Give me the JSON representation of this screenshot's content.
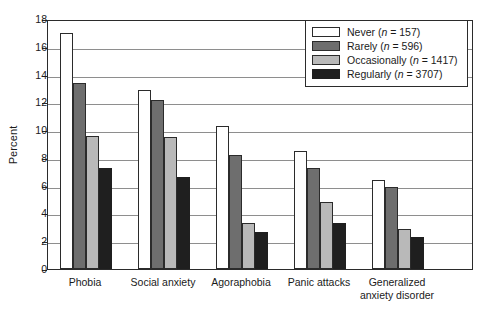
{
  "chart_data": {
    "type": "bar",
    "title": "",
    "xlabel": "",
    "ylabel": "Percent",
    "ylim": [
      0,
      18
    ],
    "ytick_step": 2,
    "yticks": [
      0,
      2,
      4,
      6,
      8,
      10,
      12,
      14,
      16,
      18
    ],
    "grid": true,
    "legend_position": "top-right",
    "categories": [
      "Phobia",
      "Social anxiety",
      "Agoraphobia",
      "Panic attacks",
      "Generalized anxiety disorder"
    ],
    "category_lines": [
      [
        "Phobia"
      ],
      [
        "Social anxiety"
      ],
      [
        "Agoraphobia"
      ],
      [
        "Panic attacks"
      ],
      [
        "Generalized",
        "anxiety disorder"
      ]
    ],
    "series": [
      {
        "name": "Never",
        "n": 157,
        "legend_label": "Never (n = 157)",
        "color": "#ffffff",
        "values": [
          17.0,
          12.9,
          10.3,
          8.5,
          6.4
        ]
      },
      {
        "name": "Rarely",
        "n": 596,
        "legend_label": "Rarely (n = 596)",
        "color": "#6e6e6e",
        "values": [
          13.4,
          12.2,
          8.2,
          7.3,
          5.9
        ]
      },
      {
        "name": "Occasionally",
        "n": 1417,
        "legend_label": "Occasionally (n = 1417)",
        "color": "#b9b9b9",
        "values": [
          9.6,
          9.5,
          3.3,
          4.8,
          2.9
        ]
      },
      {
        "name": "Regularly",
        "n": 3707,
        "legend_label": "Regularly (n = 3707)",
        "color": "#1f1f1f",
        "values": [
          7.3,
          6.6,
          2.7,
          3.3,
          2.3
        ]
      }
    ]
  },
  "legend": {
    "entries": [
      {
        "label_prefix": "Never",
        "n_text": "n",
        "n_value": "= 157"
      },
      {
        "label_prefix": "Rarely",
        "n_text": "n",
        "n_value": "= 596"
      },
      {
        "label_prefix": "Occasionally",
        "n_text": "n",
        "n_value": "= 1417"
      },
      {
        "label_prefix": "Regularly",
        "n_text": "n",
        "n_value": "= 3707"
      }
    ]
  }
}
